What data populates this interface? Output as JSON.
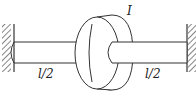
{
  "diagram": {
    "type": "torsional-shaft-with-disk",
    "disk_label": "I",
    "left_segment_label": "l/2",
    "right_segment_label": "l/2",
    "supports": [
      "fixed-wall-left",
      "fixed-wall-right"
    ],
    "colors": {
      "stroke": "#333333",
      "background": "#ffffff"
    }
  }
}
